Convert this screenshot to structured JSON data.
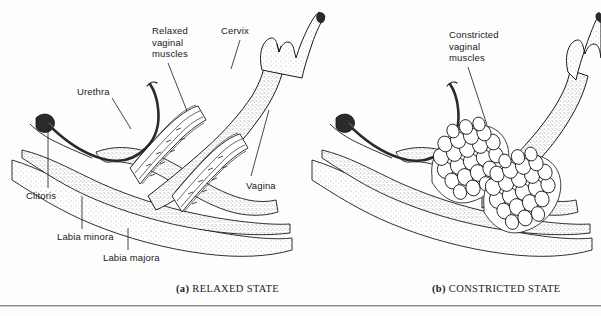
{
  "figure": {
    "background_color": "#fdfdfd",
    "ink_color": "#1a1a1a",
    "divider_color": "#8d8d8d",
    "width": 601,
    "height": 316
  },
  "panels": [
    {
      "id": "panel-a",
      "caption_tag": "(a)",
      "caption_text": "RELAXED STATE",
      "labels": [
        {
          "name": "urethra",
          "text": "Urethra",
          "x": 77,
          "y": 86,
          "leader": [
            [
              112,
              98
            ],
            [
              130,
              128
            ]
          ]
        },
        {
          "name": "relaxed-vaginal-muscles",
          "text": "Relaxed\nvaginal\nmuscles",
          "x": 152,
          "y": 25,
          "leader": [
            [
              168,
              63
            ],
            [
              186,
              110
            ]
          ]
        },
        {
          "name": "cervix",
          "text": "Cervix",
          "x": 221,
          "y": 25,
          "leader": [
            [
              240,
              40
            ],
            [
              232,
              68
            ]
          ]
        },
        {
          "name": "vagina",
          "text": "Vagina",
          "x": 246,
          "y": 180,
          "leader": [
            [
              252,
              176
            ],
            [
              268,
              112
            ]
          ]
        },
        {
          "name": "clitoris",
          "text": "Clitoris",
          "x": 26,
          "y": 190,
          "leader": [
            [
              48,
              188
            ],
            [
              48,
              127
            ]
          ]
        },
        {
          "name": "labia-minora",
          "text": "Labia minora",
          "x": 57,
          "y": 231,
          "leader": [
            [
              82,
              229
            ],
            [
              82,
              196
            ]
          ]
        },
        {
          "name": "labia-majora",
          "text": "Labia majora",
          "x": 103,
          "y": 252,
          "leader": [
            [
              128,
              250
            ],
            [
              128,
              228
            ]
          ]
        }
      ]
    },
    {
      "id": "panel-b",
      "caption_tag": "(b)",
      "caption_text": "CONSTRICTED STATE",
      "labels": [
        {
          "name": "constricted-vaginal-muscles",
          "text": "Constricted\nvaginal\nmuscles",
          "x": 449,
          "y": 29,
          "leader": [
            [
              468,
              67
            ],
            [
              486,
              124
            ]
          ]
        }
      ]
    }
  ],
  "captions": [
    {
      "name": "caption-a",
      "tag": "(a)",
      "text": " RELAXED STATE",
      "x": 176,
      "y": 283
    },
    {
      "name": "caption-b",
      "tag": "(b)",
      "text": " CONSTRICTED STATE",
      "x": 432,
      "y": 283
    }
  ]
}
